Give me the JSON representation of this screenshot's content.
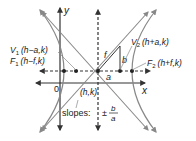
{
  "diagram": {
    "type": "hyperbola-horizontal-transverse-axis",
    "axes": {
      "x_label": "x",
      "y_label": "y",
      "origin_label": "0"
    },
    "center": {
      "label": "(h,k)"
    },
    "vertices": [
      {
        "name": "V1",
        "sub": "1",
        "coords": "(h−a,k)"
      },
      {
        "name": "V2",
        "sub": "2",
        "coords": "(h+a,k)"
      }
    ],
    "foci": [
      {
        "name": "F1",
        "sub": "1",
        "coords": "(h−f,k)"
      },
      {
        "name": "F2",
        "sub": "2",
        "coords": "(h+f,k)"
      }
    ],
    "segment_labels": {
      "a": "a",
      "b": "b",
      "f": "f"
    },
    "asymptotes": {
      "label": "slopes:",
      "pm": "±",
      "num": "b",
      "den": "a"
    },
    "colors": {
      "curve": "#888888",
      "axis": "#333333",
      "text": "#222222",
      "point": "#222222"
    }
  }
}
